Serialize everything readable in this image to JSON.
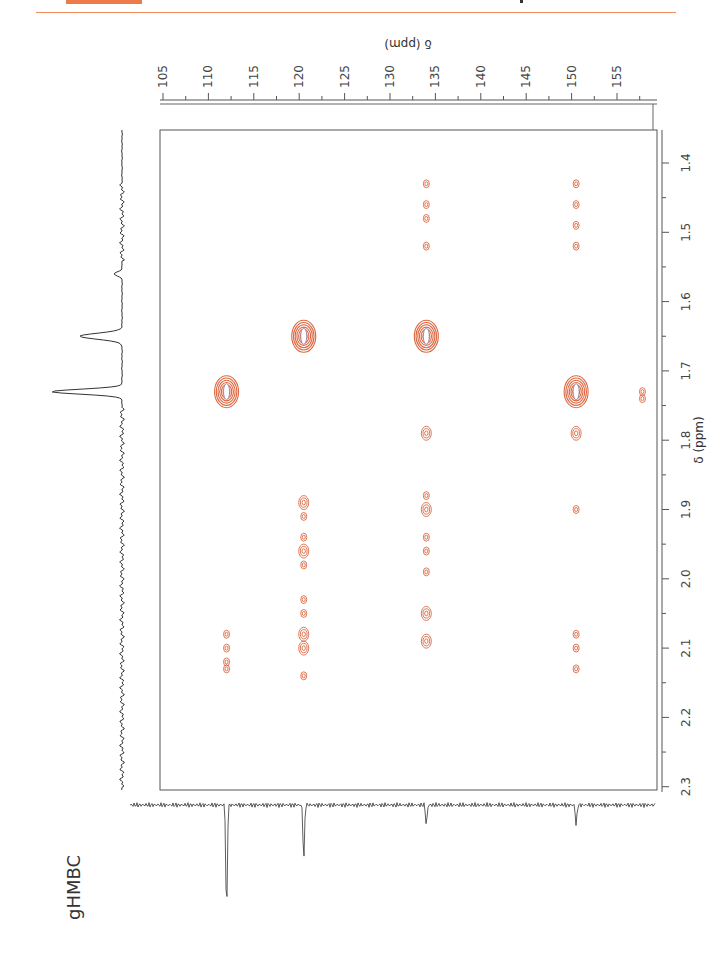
{
  "page": {
    "experiment_label": "gHMBC",
    "accent_color": "#ee7a4a",
    "contour_color": "#d9582e"
  },
  "chart_data": {
    "type": "scatter",
    "subtype": "2D NMR contour (HMBC)",
    "title": "gHMBC",
    "orientation": "rotated 90° (page in landscape)",
    "axes": {
      "carbon": {
        "label": "δ (ppm)",
        "position": "top",
        "ticks": [
          105,
          110,
          115,
          120,
          125,
          130,
          135,
          140,
          145,
          150,
          155
        ],
        "range": [
          104,
          158
        ]
      },
      "proton": {
        "label": "δ (ppm)",
        "position": "right",
        "ticks": [
          1.4,
          1.5,
          1.6,
          1.7,
          1.8,
          1.9,
          2.0,
          2.1,
          2.2,
          2.3
        ],
        "range": [
          1.32,
          2.31
        ]
      }
    },
    "projections": {
      "proton_1d_peaks_ppm": [
        1.56,
        1.65,
        1.73
      ],
      "carbon_1d_peaks_ppm": [
        112.0,
        120.5,
        134.0,
        150.5
      ]
    },
    "cross_peaks": [
      {
        "c": 112.0,
        "h": 1.73,
        "intensity": "strong"
      },
      {
        "c": 112.0,
        "h": 2.08,
        "intensity": "weak"
      },
      {
        "c": 112.0,
        "h": 2.1,
        "intensity": "weak"
      },
      {
        "c": 112.0,
        "h": 2.12,
        "intensity": "weak"
      },
      {
        "c": 112.0,
        "h": 2.13,
        "intensity": "weak"
      },
      {
        "c": 120.5,
        "h": 1.65,
        "intensity": "strong"
      },
      {
        "c": 120.5,
        "h": 1.89,
        "intensity": "medium"
      },
      {
        "c": 120.5,
        "h": 1.91,
        "intensity": "weak"
      },
      {
        "c": 120.5,
        "h": 1.94,
        "intensity": "weak"
      },
      {
        "c": 120.5,
        "h": 1.96,
        "intensity": "medium"
      },
      {
        "c": 120.5,
        "h": 1.98,
        "intensity": "weak"
      },
      {
        "c": 120.5,
        "h": 2.03,
        "intensity": "weak"
      },
      {
        "c": 120.5,
        "h": 2.05,
        "intensity": "weak"
      },
      {
        "c": 120.5,
        "h": 2.08,
        "intensity": "medium"
      },
      {
        "c": 120.5,
        "h": 2.1,
        "intensity": "medium"
      },
      {
        "c": 120.5,
        "h": 2.14,
        "intensity": "weak"
      },
      {
        "c": 134.0,
        "h": 1.43,
        "intensity": "weak"
      },
      {
        "c": 134.0,
        "h": 1.46,
        "intensity": "weak"
      },
      {
        "c": 134.0,
        "h": 1.48,
        "intensity": "weak"
      },
      {
        "c": 134.0,
        "h": 1.52,
        "intensity": "weak"
      },
      {
        "c": 134.0,
        "h": 1.65,
        "intensity": "strong"
      },
      {
        "c": 134.0,
        "h": 1.79,
        "intensity": "medium"
      },
      {
        "c": 134.0,
        "h": 1.88,
        "intensity": "weak"
      },
      {
        "c": 134.0,
        "h": 1.9,
        "intensity": "medium"
      },
      {
        "c": 134.0,
        "h": 1.94,
        "intensity": "weak"
      },
      {
        "c": 134.0,
        "h": 1.96,
        "intensity": "weak"
      },
      {
        "c": 134.0,
        "h": 1.99,
        "intensity": "weak"
      },
      {
        "c": 134.0,
        "h": 2.05,
        "intensity": "medium"
      },
      {
        "c": 134.0,
        "h": 2.09,
        "intensity": "medium"
      },
      {
        "c": 150.5,
        "h": 1.43,
        "intensity": "weak"
      },
      {
        "c": 150.5,
        "h": 1.46,
        "intensity": "weak"
      },
      {
        "c": 150.5,
        "h": 1.49,
        "intensity": "weak"
      },
      {
        "c": 150.5,
        "h": 1.52,
        "intensity": "weak"
      },
      {
        "c": 150.5,
        "h": 1.73,
        "intensity": "strong"
      },
      {
        "c": 150.5,
        "h": 1.79,
        "intensity": "medium"
      },
      {
        "c": 150.5,
        "h": 1.9,
        "intensity": "weak"
      },
      {
        "c": 150.5,
        "h": 2.08,
        "intensity": "weak"
      },
      {
        "c": 150.5,
        "h": 2.1,
        "intensity": "weak"
      },
      {
        "c": 150.5,
        "h": 2.13,
        "intensity": "weak"
      },
      {
        "c": 157.8,
        "h": 1.73,
        "intensity": "weak"
      },
      {
        "c": 157.8,
        "h": 1.74,
        "intensity": "weak"
      }
    ],
    "grid": false,
    "legend": null
  }
}
